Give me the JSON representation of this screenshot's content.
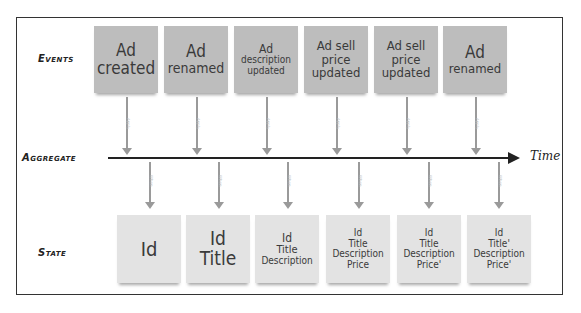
{
  "row_labels": {
    "events": "Events",
    "aggregate": "Aggregate",
    "state": "State"
  },
  "timeline": {
    "label": "Time"
  },
  "arrow_labels": {
    "apply": "Apply",
    "when": "When"
  },
  "events": [
    {
      "lines": [
        "Ad",
        "created"
      ]
    },
    {
      "lines": [
        "Ad",
        "renamed"
      ]
    },
    {
      "lines": [
        "Ad",
        "description",
        "updated"
      ]
    },
    {
      "lines": [
        "Ad sell",
        "price",
        "updated"
      ]
    },
    {
      "lines": [
        "Ad sell",
        "price",
        "updated"
      ]
    },
    {
      "lines": [
        "Ad",
        "renamed"
      ]
    }
  ],
  "states": [
    {
      "lines": [
        "Id"
      ]
    },
    {
      "lines": [
        "Id",
        "Title"
      ]
    },
    {
      "lines": [
        "Id",
        "Title",
        "Description"
      ]
    },
    {
      "lines": [
        "Id",
        "Title",
        "Description",
        "Price"
      ]
    },
    {
      "lines": [
        "Id",
        "Title",
        "Description",
        "Price'"
      ]
    },
    {
      "lines": [
        "Id",
        "Title'",
        "Description",
        "Price'"
      ]
    }
  ],
  "colors": {
    "event_note": "#bdbdbd",
    "state_note": "#e3e3e3",
    "arrow": "#9a9a9a",
    "timeline": "#222222"
  }
}
